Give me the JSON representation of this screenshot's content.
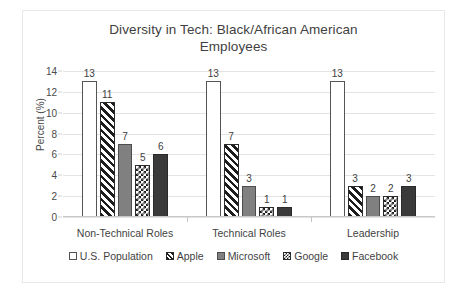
{
  "chart_data": {
    "type": "bar",
    "title": "Diversity in Tech: Black/African American Employees",
    "title_lines": [
      "Diversity in Tech: Black/African American",
      "Employees"
    ],
    "xlabel": "",
    "ylabel": "Percent (%)",
    "ylim": [
      0,
      14
    ],
    "ytick_step": 2,
    "yticks": [
      0,
      2,
      4,
      6,
      8,
      10,
      12,
      14
    ],
    "ytick_labels": [
      "0",
      "2",
      "4",
      "6",
      "8",
      "10",
      "12",
      "14"
    ],
    "grid": true,
    "legend_position": "bottom",
    "categories": [
      "Non-Technical Roles",
      "Technical Roles",
      "Leadership"
    ],
    "series": [
      {
        "name": "U.S. Population",
        "pattern": "solid-white",
        "color": "#ffffff",
        "values": [
          13,
          13,
          13
        ],
        "labels": [
          "13",
          "13",
          "13"
        ]
      },
      {
        "name": "Apple",
        "pattern": "diagonal-hatch",
        "color": "#1d1d1d",
        "values": [
          11,
          7,
          3
        ],
        "labels": [
          "11",
          "7",
          "3"
        ]
      },
      {
        "name": "Microsoft",
        "pattern": "solid-gray",
        "color": "#808080",
        "values": [
          7,
          3,
          2
        ],
        "labels": [
          "7",
          "3",
          "2"
        ]
      },
      {
        "name": "Google",
        "pattern": "checkerboard",
        "color": "#1d1d1d",
        "values": [
          5,
          1,
          2
        ],
        "labels": [
          "5",
          "1",
          "2"
        ]
      },
      {
        "name": "Facebook",
        "pattern": "solid-dark",
        "color": "#3a3a3a",
        "values": [
          6,
          1,
          3
        ],
        "labels": [
          "6",
          "1",
          "3"
        ]
      }
    ]
  }
}
